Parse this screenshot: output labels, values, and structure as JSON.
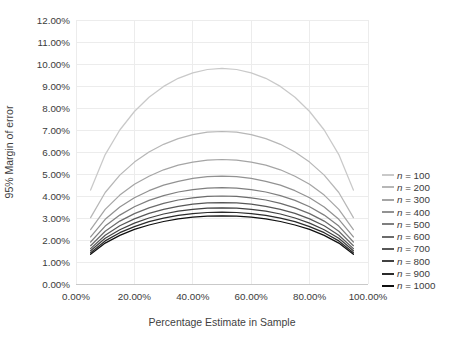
{
  "chart_data": {
    "type": "line",
    "title": "",
    "xlabel": "Percentage Estimate in Sample",
    "ylabel": "95% Margin of error",
    "xlim": [
      0,
      100
    ],
    "ylim": [
      0,
      12
    ],
    "grid": true,
    "legend_position": "right",
    "colors": {
      "gridline": "#ececec",
      "axis_line": "#c9c9c9",
      "tick_text": "#3b3b3b"
    },
    "x_ticks": {
      "values": [
        0,
        20,
        40,
        60,
        80,
        100
      ],
      "labels": [
        "0.00%",
        "20.00%",
        "40.00%",
        "60.00%",
        "80.00%",
        "100.00%"
      ]
    },
    "y_ticks": {
      "values": [
        0,
        1,
        2,
        3,
        4,
        5,
        6,
        7,
        8,
        9,
        10,
        11,
        12
      ],
      "labels": [
        "0.00%",
        "1.00%",
        "2.00%",
        "3.00%",
        "4.00%",
        "5.00%",
        "6.00%",
        "7.00%",
        "8.00%",
        "9.00%",
        "10.00%",
        "11.00%",
        "12.00%"
      ]
    },
    "x": [
      5,
      10,
      15,
      20,
      25,
      30,
      35,
      40,
      45,
      50,
      55,
      60,
      65,
      70,
      75,
      80,
      85,
      90,
      95
    ],
    "series": [
      {
        "name": "n = 100",
        "color": "#c9c9c9",
        "values": [
          4.27,
          5.88,
          7.0,
          7.84,
          8.49,
          8.98,
          9.35,
          9.6,
          9.75,
          9.8,
          9.75,
          9.6,
          9.35,
          8.98,
          8.49,
          7.84,
          7.0,
          5.88,
          4.27
        ]
      },
      {
        "name": "n = 200",
        "color": "#b7b7b7",
        "values": [
          3.02,
          4.16,
          4.95,
          5.54,
          6.0,
          6.35,
          6.61,
          6.79,
          6.9,
          6.93,
          6.9,
          6.79,
          6.61,
          6.35,
          6.0,
          5.54,
          4.95,
          4.16,
          3.02
        ]
      },
      {
        "name": "n = 300",
        "color": "#a5a5a5",
        "values": [
          2.47,
          3.39,
          4.04,
          4.53,
          4.9,
          5.19,
          5.4,
          5.54,
          5.63,
          5.66,
          5.63,
          5.54,
          5.4,
          5.19,
          4.9,
          4.53,
          4.04,
          3.39,
          2.47
        ]
      },
      {
        "name": "n = 400",
        "color": "#929292",
        "values": [
          2.14,
          2.94,
          3.5,
          3.92,
          4.24,
          4.49,
          4.67,
          4.8,
          4.88,
          4.9,
          4.88,
          4.8,
          4.67,
          4.49,
          4.24,
          3.92,
          3.5,
          2.94,
          2.14
        ]
      },
      {
        "name": "n = 500",
        "color": "#7f7f7f",
        "values": [
          1.91,
          2.63,
          3.13,
          3.51,
          3.8,
          4.02,
          4.18,
          4.29,
          4.36,
          4.38,
          4.36,
          4.29,
          4.18,
          4.02,
          3.8,
          3.51,
          3.13,
          2.63,
          1.91
        ]
      },
      {
        "name": "n = 600",
        "color": "#6b6b6b",
        "values": [
          1.74,
          2.4,
          2.86,
          3.2,
          3.46,
          3.67,
          3.82,
          3.92,
          3.98,
          4.0,
          3.98,
          3.92,
          3.82,
          3.67,
          3.46,
          3.2,
          2.86,
          2.4,
          1.74
        ]
      },
      {
        "name": "n = 700",
        "color": "#575757",
        "values": [
          1.61,
          2.22,
          2.65,
          2.96,
          3.21,
          3.39,
          3.53,
          3.63,
          3.69,
          3.7,
          3.69,
          3.63,
          3.53,
          3.39,
          3.21,
          2.96,
          2.65,
          2.22,
          1.61
        ]
      },
      {
        "name": "n = 800",
        "color": "#414141",
        "values": [
          1.51,
          2.08,
          2.47,
          2.77,
          3.0,
          3.18,
          3.31,
          3.39,
          3.45,
          3.46,
          3.45,
          3.39,
          3.31,
          3.18,
          3.0,
          2.77,
          2.47,
          2.08,
          1.51
        ]
      },
      {
        "name": "n = 900",
        "color": "#2a2a2a",
        "values": [
          1.42,
          1.96,
          2.33,
          2.61,
          2.83,
          2.99,
          3.12,
          3.2,
          3.25,
          3.27,
          3.25,
          3.2,
          3.12,
          2.99,
          2.83,
          2.61,
          2.33,
          1.96,
          1.42
        ]
      },
      {
        "name": "n = 1000",
        "color": "#0f0f0f",
        "values": [
          1.35,
          1.86,
          2.21,
          2.48,
          2.68,
          2.84,
          2.96,
          3.04,
          3.08,
          3.1,
          3.08,
          3.04,
          2.96,
          2.84,
          2.68,
          2.48,
          2.21,
          1.86,
          1.35
        ]
      }
    ]
  }
}
